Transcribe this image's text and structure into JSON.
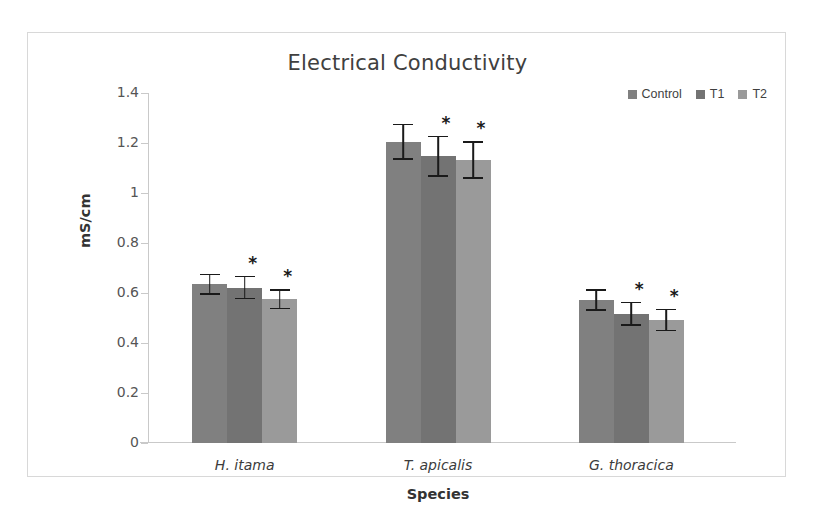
{
  "chart_data": {
    "type": "bar",
    "title": "Electrical Conductivity",
    "xlabel": "Species",
    "ylabel": "mS/cm",
    "categories": [
      "H. itama",
      "T. apicalis",
      "G. thoracica"
    ],
    "series": [
      {
        "name": "Control",
        "color": "#808080",
        "values": [
          0.635,
          1.205,
          0.573
        ],
        "errors": [
          0.043,
          0.073,
          0.043
        ],
        "significance": [
          "",
          "",
          ""
        ]
      },
      {
        "name": "T1",
        "color": "#737373",
        "values": [
          0.622,
          1.148,
          0.518
        ],
        "errors": [
          0.047,
          0.082,
          0.048
        ],
        "significance": [
          "*",
          "*",
          "*"
        ]
      },
      {
        "name": "T2",
        "color": "#9a9a9a",
        "values": [
          0.575,
          1.133,
          0.492
        ],
        "errors": [
          0.04,
          0.075,
          0.045
        ],
        "significance": [
          "*",
          "*",
          "*"
        ]
      }
    ],
    "ylim": [
      0,
      1.4
    ],
    "yticks": [
      "0",
      "0.2",
      "0.4",
      "0.6",
      "0.8",
      "1",
      "1.2",
      "1.4"
    ],
    "ytick_values": [
      0,
      0.2,
      0.4,
      0.6,
      0.8,
      1,
      1.2,
      1.4
    ],
    "grid": false,
    "legend_position": "top-right",
    "significance_marker": "*"
  },
  "legend": {
    "items": [
      {
        "label": "Control",
        "color": "#808080"
      },
      {
        "label": "T1",
        "color": "#737373"
      },
      {
        "label": "T2",
        "color": "#9a9a9a"
      }
    ]
  }
}
